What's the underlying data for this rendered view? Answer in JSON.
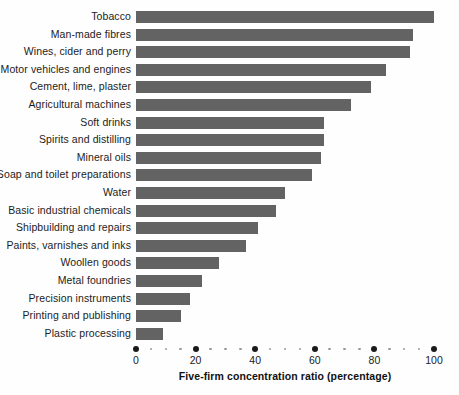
{
  "chart_data": {
    "type": "bar",
    "orientation": "horizontal",
    "title": "",
    "xlabel": "Five-firm concentration ratio (percentage)",
    "ylabel": "",
    "xlim": [
      0,
      100
    ],
    "xticks": [
      0,
      20,
      40,
      60,
      80,
      100
    ],
    "xtick_labels": [
      "0",
      "20",
      "40",
      "60",
      "80",
      "100"
    ],
    "minor_tick_step": 5,
    "grid": false,
    "legend": null,
    "bar_color": "#636363",
    "categories": [
      "Tobacco",
      "Man-made fibres",
      "Wines, cider and perry",
      "Motor vehicles and engines",
      "Cement, lime, plaster",
      "Agricultural machines",
      "Soft drinks",
      "Spirits and distilling",
      "Mineral oils",
      "Soap and toilet preparations",
      "Water",
      "Basic industrial chemicals",
      "Shipbuilding and repairs",
      "Paints, varnishes and inks",
      "Woollen goods",
      "Metal foundries",
      "Precision instruments",
      "Printing and publishing",
      "Plastic processing"
    ],
    "values": [
      100,
      93,
      92,
      84,
      79,
      72,
      63,
      63,
      62,
      59,
      50,
      47,
      41,
      37,
      28,
      22,
      18,
      15,
      9
    ]
  }
}
